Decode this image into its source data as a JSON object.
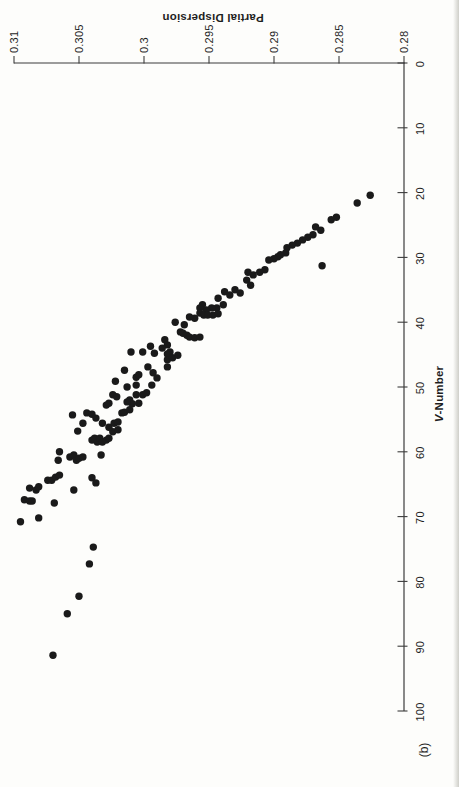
{
  "figure": {
    "panel_label": "(b)",
    "x_axis_title": "V-Number",
    "x_axis_title_italic_prefix": "V",
    "x_axis_title_suffix": "-Number",
    "y_axis_title": "Partial Dispersion"
  },
  "colors": {
    "ink": "#1a1a1a",
    "axis": "#3c3c3c",
    "paper": "#fdfdfb",
    "page_edge": "#cfcfc9"
  },
  "chart_data": {
    "type": "scatter",
    "title": "",
    "xlabel": "V-Number",
    "ylabel": "Partial Dispersion",
    "panel_label": "(b)",
    "xlim": [
      0,
      100
    ],
    "ylim": [
      0.28,
      0.31
    ],
    "x_ticks": [
      0,
      10,
      20,
      30,
      40,
      50,
      60,
      70,
      80,
      90,
      100
    ],
    "x_tick_labels": [
      "0",
      "10",
      "20",
      "30",
      "40",
      "50",
      "60",
      "70",
      "80",
      "90",
      "100"
    ],
    "y_ticks": [
      0.31,
      0.305,
      0.3,
      0.295,
      0.29,
      0.285,
      0.28
    ],
    "y_tick_labels": [
      "0.31",
      "0.305",
      "0.3",
      "0.295",
      "0.29",
      "0.285",
      "0.28"
    ],
    "grid": false,
    "legend": null,
    "layout_note": "landscape plot printed rotated 90deg CCW on portrait page: V-Number axis runs down right edge, Partial Dispersion axis runs along top edge decreasing left-to-right",
    "points_format": [
      "V-Number",
      "Partial Dispersion"
    ],
    "points": [
      [
        20.4,
        0.2826
      ],
      [
        21.6,
        0.2836
      ],
      [
        23.8,
        0.2852
      ],
      [
        24.2,
        0.2856
      ],
      [
        25.8,
        0.2864
      ],
      [
        25.3,
        0.2868
      ],
      [
        26.5,
        0.287
      ],
      [
        26.9,
        0.2874
      ],
      [
        27.3,
        0.2878
      ],
      [
        27.8,
        0.2882
      ],
      [
        28.1,
        0.2886
      ],
      [
        28.5,
        0.289
      ],
      [
        29.3,
        0.2891
      ],
      [
        29.6,
        0.2895
      ],
      [
        31.3,
        0.2863
      ],
      [
        29.9,
        0.2897
      ],
      [
        30.2,
        0.29
      ],
      [
        30.4,
        0.2904
      ],
      [
        31.9,
        0.2907
      ],
      [
        32.3,
        0.2911
      ],
      [
        32.7,
        0.2916
      ],
      [
        32.3,
        0.292
      ],
      [
        33.5,
        0.2921
      ],
      [
        34.3,
        0.2918
      ],
      [
        35.0,
        0.293
      ],
      [
        35.5,
        0.2926
      ],
      [
        35.8,
        0.2934
      ],
      [
        35.3,
        0.2938
      ],
      [
        36.3,
        0.2943
      ],
      [
        37.3,
        0.2939
      ],
      [
        37.8,
        0.2944
      ],
      [
        37.8,
        0.2948
      ],
      [
        38.1,
        0.2952
      ],
      [
        37.3,
        0.2955
      ],
      [
        37.8,
        0.2957
      ],
      [
        38.6,
        0.2957
      ],
      [
        38.9,
        0.2954
      ],
      [
        38.9,
        0.2951
      ],
      [
        38.9,
        0.2947
      ],
      [
        38.7,
        0.2943
      ],
      [
        39.4,
        0.2961
      ],
      [
        39.2,
        0.2965
      ],
      [
        40.4,
        0.2969
      ],
      [
        40.0,
        0.2976
      ],
      [
        41.5,
        0.2972
      ],
      [
        41.7,
        0.297
      ],
      [
        42.0,
        0.2967
      ],
      [
        42.3,
        0.2965
      ],
      [
        42.4,
        0.2961
      ],
      [
        42.3,
        0.2957
      ],
      [
        42.7,
        0.2984
      ],
      [
        43.5,
        0.2982
      ],
      [
        44.0,
        0.2986
      ],
      [
        44.6,
        0.298
      ],
      [
        43.7,
        0.2995
      ],
      [
        44.8,
        0.2992
      ],
      [
        44.9,
        0.2982
      ],
      [
        44.6,
        0.3001
      ],
      [
        44.6,
        0.301
      ],
      [
        46.9,
        0.2997
      ],
      [
        45.8,
        0.2982
      ],
      [
        46.9,
        0.2982
      ],
      [
        45.5,
        0.2978
      ],
      [
        45.1,
        0.2974
      ],
      [
        47.4,
        0.3015
      ],
      [
        48.5,
        0.3006
      ],
      [
        48.1,
        0.3004
      ],
      [
        47.8,
        0.2993
      ],
      [
        48.6,
        0.299
      ],
      [
        49.7,
        0.2994
      ],
      [
        49.1,
        0.3022
      ],
      [
        50.0,
        0.3013
      ],
      [
        49.7,
        0.3006
      ],
      [
        51.2,
        0.3024
      ],
      [
        51.5,
        0.3021
      ],
      [
        52.0,
        0.3011
      ],
      [
        51.2,
        0.3006
      ],
      [
        51.2,
        0.3001
      ],
      [
        50.9,
        0.2998
      ],
      [
        52.8,
        0.3029
      ],
      [
        52.5,
        0.3027
      ],
      [
        52.5,
        0.3004
      ],
      [
        52.6,
        0.3009
      ],
      [
        52.3,
        0.3013
      ],
      [
        54.3,
        0.3055
      ],
      [
        54.0,
        0.3044
      ],
      [
        54.2,
        0.304
      ],
      [
        54.8,
        0.3037
      ],
      [
        56.8,
        0.3051
      ],
      [
        55.6,
        0.3047
      ],
      [
        55.6,
        0.3032
      ],
      [
        56.2,
        0.3027
      ],
      [
        56.9,
        0.3024
      ],
      [
        55.6,
        0.3023
      ],
      [
        55.4,
        0.302
      ],
      [
        54.0,
        0.3017
      ],
      [
        53.9,
        0.3015
      ],
      [
        53.5,
        0.3011
      ],
      [
        56.6,
        0.302
      ],
      [
        58.2,
        0.304
      ],
      [
        57.9,
        0.3038
      ],
      [
        58.5,
        0.3036
      ],
      [
        57.9,
        0.3034
      ],
      [
        58.5,
        0.3032
      ],
      [
        58.2,
        0.3029
      ],
      [
        57.9,
        0.3027
      ],
      [
        60.0,
        0.3065
      ],
      [
        61.3,
        0.3066
      ],
      [
        60.8,
        0.3057
      ],
      [
        60.5,
        0.3054
      ],
      [
        61.3,
        0.3052
      ],
      [
        61.0,
        0.305
      ],
      [
        60.8,
        0.3047
      ],
      [
        60.5,
        0.3033
      ],
      [
        64.4,
        0.3074
      ],
      [
        64.4,
        0.3071
      ],
      [
        63.9,
        0.3068
      ],
      [
        63.6,
        0.3065
      ],
      [
        65.6,
        0.3088
      ],
      [
        65.9,
        0.3083
      ],
      [
        65.4,
        0.3081
      ],
      [
        64.0,
        0.304
      ],
      [
        64.8,
        0.3037
      ],
      [
        65.9,
        0.3054
      ],
      [
        67.4,
        0.3092
      ],
      [
        67.6,
        0.3088
      ],
      [
        67.6,
        0.3086
      ],
      [
        67.9,
        0.3069
      ],
      [
        70.8,
        0.3095
      ],
      [
        70.2,
        0.3081
      ],
      [
        74.7,
        0.3039
      ],
      [
        77.3,
        0.3042
      ],
      [
        82.3,
        0.305
      ],
      [
        85.0,
        0.3059
      ],
      [
        91.4,
        0.307
      ]
    ]
  }
}
